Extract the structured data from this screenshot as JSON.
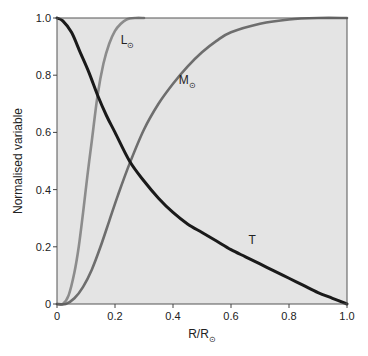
{
  "chart_data": {
    "type": "line",
    "title": "",
    "xlabel": "R/R⊙",
    "ylabel": "Normalised variable",
    "xlim": [
      0,
      1.0
    ],
    "ylim": [
      0,
      1.0
    ],
    "x_ticks": [
      "0",
      "0.2",
      "0.4",
      "0.6",
      "0.8",
      "1.0"
    ],
    "y_ticks": [
      "0",
      "0.2",
      "0.4",
      "0.6",
      "0.8",
      "1.0"
    ],
    "grid": false,
    "background": "#e4e4e4",
    "series": [
      {
        "name": "L⊙",
        "label_position": {
          "x": 0.22,
          "y": 0.91
        },
        "color": "#8c8c8c",
        "x": [
          0,
          0.02,
          0.04,
          0.06,
          0.075,
          0.09,
          0.105,
          0.12,
          0.14,
          0.16,
          0.18,
          0.2,
          0.22,
          0.24,
          0.27,
          0.3
        ],
        "y": [
          0,
          0.0,
          0.03,
          0.11,
          0.2,
          0.32,
          0.45,
          0.57,
          0.73,
          0.84,
          0.91,
          0.955,
          0.98,
          0.995,
          1.0,
          1.0
        ]
      },
      {
        "name": "M⊙",
        "label_position": {
          "x": 0.42,
          "y": 0.77
        },
        "color": "#6e6e6e",
        "x": [
          0,
          0.03,
          0.06,
          0.09,
          0.12,
          0.15,
          0.18,
          0.21,
          0.25,
          0.3,
          0.35,
          0.4,
          0.45,
          0.5,
          0.55,
          0.6,
          0.7,
          0.8,
          0.9,
          1.0
        ],
        "y": [
          0,
          0.0,
          0.02,
          0.06,
          0.12,
          0.2,
          0.29,
          0.38,
          0.49,
          0.61,
          0.7,
          0.77,
          0.83,
          0.88,
          0.92,
          0.95,
          0.98,
          0.995,
          1.0,
          1.0
        ]
      },
      {
        "name": "T",
        "label_position": {
          "x": 0.66,
          "y": 0.21
        },
        "color": "#1a1a1a",
        "x": [
          0,
          0.02,
          0.05,
          0.08,
          0.11,
          0.14,
          0.17,
          0.2,
          0.25,
          0.3,
          0.35,
          0.4,
          0.45,
          0.5,
          0.55,
          0.6,
          0.65,
          0.7,
          0.75,
          0.8,
          0.85,
          0.9,
          0.95,
          1.0
        ],
        "y": [
          1.0,
          0.99,
          0.95,
          0.88,
          0.81,
          0.73,
          0.66,
          0.6,
          0.5,
          0.43,
          0.37,
          0.32,
          0.28,
          0.25,
          0.22,
          0.19,
          0.165,
          0.14,
          0.115,
          0.09,
          0.065,
          0.04,
          0.02,
          0.0
        ]
      }
    ]
  }
}
